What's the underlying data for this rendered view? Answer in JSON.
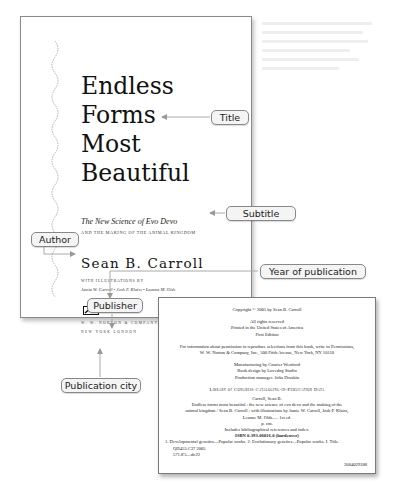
{
  "title_page": {
    "title_lines": [
      "Endless",
      "Forms",
      "Most",
      "Beautiful"
    ],
    "subtitle_line1": "The New Science of Evo Devo",
    "subtitle_line2": "AND THE MAKING OF THE ANIMAL KINGDOM",
    "author": "Sean B. Carroll",
    "illustrations_label": "WITH ILLUSTRATIONS BY",
    "illustrators": "Jamie W. Carroll  •  Josh P. Klaiss  •  Leanne M. Olds",
    "publisher": "W. W. NORTON & COMPANY",
    "publication_cities": "NEW YORK   LONDON"
  },
  "copyright_page": {
    "copyright": "Copyright © 2005 by Sean B. Carroll",
    "rights": [
      "All rights reserved",
      "Printed in the United States of America",
      "First Edition"
    ],
    "permissions": [
      "For information about permission to reproduce selections from this book, write to Permissions,",
      "W. W. Norton & Company, Inc., 500 Fifth Avenue, New York, NY 10110"
    ],
    "credits": [
      "Manufacturing by Courier Westford",
      "Book design by Lovedog Studio",
      "Production manager: Julia Druskin"
    ],
    "cip_heading": "Library of Congress Cataloging-in-Publication Data",
    "cip": [
      "Carroll, Sean B.",
      "Endless forms most beautiful : the new science of evo devo and the making of the",
      "animal kingdom / Sean B. Carroll ; with illustrations by Jamie W. Carroll, Josh P. Klaiss,",
      "Leanne M. Olds.— 1st ed.",
      "p. cm.",
      "Includes bibliographical references and index.",
      "ISBN 0-393-06016-0 (hardcover)"
    ],
    "subjects": "1. Developmental genetics—Popular works.  2. Evolutionary genetics—Popular works. I. Title.",
    "classification": [
      "QH453.C37 2005",
      "571.8'5—dc22"
    ],
    "record_number": "2004029388"
  },
  "annotations": {
    "title": "Title",
    "subtitle": "Subtitle",
    "author": "Author",
    "publisher": "Publisher",
    "publication_city": "Publication city",
    "year": "Year of publication"
  }
}
